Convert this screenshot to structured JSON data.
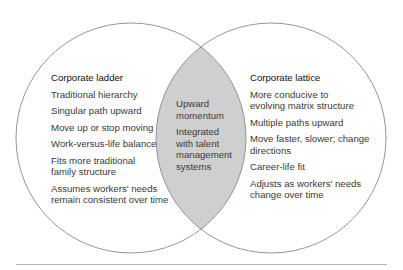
{
  "diagram": {
    "type": "venn",
    "left": {
      "title": "Corporate ladder",
      "items": [
        "Traditional hierarchy",
        "Singular path upward",
        "Move up or stop moving",
        "Work-versus-life balance",
        "Fits more traditional family structure",
        "Assumes workers' needs remain consistent over time"
      ]
    },
    "overlap": {
      "items": [
        "Upward momentum",
        "Integrated with talent management systems"
      ]
    },
    "right": {
      "title": "Corporate lattice",
      "items": [
        "More conducive to evolving matrix structure",
        "Multiple paths upward",
        "Move faster, slower; change directions",
        "Career-life fit",
        "Adjusts as workers' needs change over time"
      ]
    },
    "colors": {
      "circle_stroke": "#8a8a8a",
      "overlap_fill": "#cfcfcf",
      "rule": "#b5b5b5"
    }
  }
}
